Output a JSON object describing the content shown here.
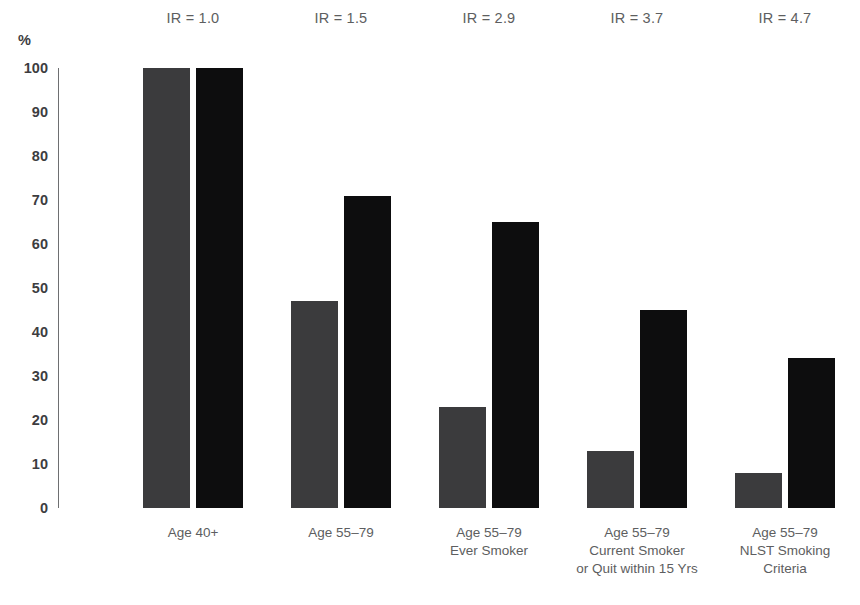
{
  "chart_data": {
    "type": "bar",
    "title": "",
    "subtitle": "",
    "xlabel": "",
    "ylabel": "%",
    "ylim": [
      0,
      100
    ],
    "grid": false,
    "legend_position": "none",
    "y_ticks": [
      "100",
      "90",
      "80",
      "70",
      "60",
      "50",
      "40",
      "30",
      "20",
      "10",
      "0"
    ],
    "y_tick_values": [
      100,
      90,
      80,
      70,
      60,
      50,
      40,
      30,
      20,
      10,
      0
    ],
    "categories": [
      "Age 40+",
      "Age 55–79",
      "Age 55–79 Ever Smoker",
      "Age 55–79 Current Smoker or Quit within 15 Yrs",
      "Age 55–79 NLST Smoking Criteria"
    ],
    "category_lines": [
      [
        "Age 40+"
      ],
      [
        "Age 55–79"
      ],
      [
        "Age 55–79",
        "Ever Smoker"
      ],
      [
        "Age 55–79",
        "Current Smoker",
        "or Quit within 15 Yrs"
      ],
      [
        "Age 55–79",
        "NLST Smoking",
        "Criteria"
      ]
    ],
    "series": [
      {
        "name": "Population",
        "color": "#3b3b3d",
        "values": [
          100,
          47,
          23,
          13,
          8
        ]
      },
      {
        "name": "Lung Cancer Cases",
        "color": "#0d0d0e",
        "values": [
          100,
          71,
          65,
          45,
          34
        ]
      }
    ],
    "annotations": [
      {
        "text": "IR = 1.0",
        "value": 1.0,
        "category_index": 0
      },
      {
        "text": "IR = 1.5",
        "value": 1.5,
        "category_index": 1
      },
      {
        "text": "IR = 2.9",
        "value": 2.9,
        "category_index": 2
      },
      {
        "text": "IR = 3.7",
        "value": 3.7,
        "category_index": 3
      },
      {
        "text": "IR = 4.7",
        "value": 4.7,
        "category_index": 4
      }
    ]
  },
  "axis": {
    "y_caption": "%"
  },
  "geometry": {
    "y_top_px": 68,
    "y_bottom_px": 508,
    "axis_x_px": 58,
    "bar_width_px": 47,
    "bar_gap_px": 6,
    "group_centers_px": [
      193,
      341,
      489,
      637,
      785
    ]
  }
}
